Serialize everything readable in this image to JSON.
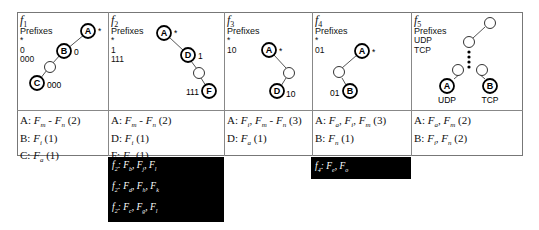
{
  "columns": [
    {
      "id": "f1",
      "title": "f",
      "title_sub": "1",
      "prefix_label": "Prefixes",
      "prefixes": [
        "*",
        "0",
        "000"
      ],
      "tree": {
        "nodes": [
          {
            "label": "A",
            "annotation": "*"
          },
          {
            "label": "B",
            "annotation": "0"
          },
          {
            "label": "",
            "annotation": ""
          },
          {
            "label": "C",
            "annotation": "000"
          }
        ]
      },
      "rules": [
        {
          "node": "A",
          "text": "A: ",
          "flows": "F",
          "sub1": "m",
          "sep": " - ",
          "flows2": "F",
          "sub2": "n",
          "count": " (2)"
        },
        {
          "node": "B",
          "text": "B: ",
          "flows": "F",
          "sub1": "i",
          "count": " (1)"
        },
        {
          "node": "C",
          "text": "C: ",
          "flows": "F",
          "sub1": "a",
          "count": " (1)"
        }
      ]
    },
    {
      "id": "f2",
      "title": "f",
      "title_sub": "2",
      "prefix_label": "Prefixes",
      "prefixes": [
        "*",
        "1",
        "111"
      ],
      "tree": {
        "nodes": [
          {
            "label": "A",
            "annotation": "*"
          },
          {
            "label": "D",
            "annotation": "1"
          },
          {
            "label": "",
            "annotation": ""
          },
          {
            "label": "F",
            "annotation": "111"
          }
        ]
      },
      "rules": [
        {
          "node": "A",
          "text": "A: ",
          "flows": "F",
          "sub1": "m",
          "sep": " - ",
          "flows2": "F",
          "sub2": "n",
          "count": " (2)"
        },
        {
          "node": "D",
          "text": "D: ",
          "flows": "F",
          "sub1": "i",
          "count": " (1)"
        },
        {
          "node": "F",
          "text": "F: ",
          "flows": "F",
          "sub1": "a",
          "count": " (1)"
        }
      ],
      "overflow": [
        {
          "f": "f",
          "fsub": "2",
          "items": [
            {
              "F": "F",
              "s": "b"
            },
            {
              "F": "F",
              "s": "j"
            },
            {
              "F": "F",
              "s": "l"
            }
          ]
        },
        {
          "f": "f",
          "fsub": "2",
          "items": [
            {
              "F": "F",
              "s": "d"
            },
            {
              "F": "F",
              "s": "h"
            },
            {
              "F": "F",
              "s": "k"
            }
          ]
        },
        {
          "f": "f",
          "fsub": "2",
          "items": [
            {
              "F": "F",
              "s": "c"
            },
            {
              "F": "F",
              "s": "g"
            },
            {
              "F": "F",
              "s": "l"
            }
          ]
        }
      ]
    },
    {
      "id": "f3",
      "title": "f",
      "title_sub": "3",
      "prefix_label": "Prefixes",
      "prefixes": [
        "*",
        "10"
      ],
      "tree": {
        "nodes": [
          {
            "label": "A",
            "annotation": "*"
          },
          {
            "label": "",
            "annotation": ""
          },
          {
            "label": "D",
            "annotation": "10"
          }
        ]
      },
      "rules": [
        {
          "node": "A",
          "text": "A: ",
          "flows": "F",
          "sub1": "i",
          "mid": ", ",
          "flowsM": "F",
          "subM": "m",
          "sep": " - ",
          "flows2": "F",
          "sub2": "n",
          "count": " (3)"
        },
        {
          "node": "D",
          "text": "D: ",
          "flows": "F",
          "sub1": "a",
          "count": " (1)"
        }
      ]
    },
    {
      "id": "f4",
      "title": "f",
      "title_sub": "4",
      "prefix_label": "Prefixes",
      "prefixes": [
        "*",
        "01"
      ],
      "tree": {
        "nodes": [
          {
            "label": "A",
            "annotation": "*"
          },
          {
            "label": "",
            "annotation": ""
          },
          {
            "label": "B",
            "annotation": "01"
          }
        ]
      },
      "rules": [
        {
          "node": "A",
          "text": "A: ",
          "flows": "F",
          "sub1": "a",
          "mid": ", ",
          "flowsM": "F",
          "subM": "i",
          "sep": ", ",
          "flows2": "F",
          "sub2": "m",
          "count": " (3)"
        },
        {
          "node": "B",
          "text": "B: ",
          "flows": "F",
          "sub1": "n",
          "count": " (1)"
        }
      ],
      "overflow": [
        {
          "f": "f",
          "fsub": "4",
          "items": [
            {
              "F": "F",
              "s": "e"
            },
            {
              "F": "F",
              "s": "o"
            }
          ]
        }
      ]
    },
    {
      "id": "f5",
      "title": "f",
      "title_sub": "5",
      "prefix_label": "Prefixes",
      "prefixes": [
        "UDP",
        "TCP"
      ],
      "tree": {
        "nodes": [
          {
            "label": "",
            "annotation": ""
          },
          {
            "label": "",
            "annotation": ""
          },
          {
            "label": "",
            "annotation": ""
          },
          {
            "label": "",
            "annotation": ""
          },
          {
            "label": "A",
            "annotation": "UDP"
          },
          {
            "label": "B",
            "annotation": "TCP"
          }
        ]
      },
      "rules": [
        {
          "node": "A",
          "text": "A: ",
          "flows": "F",
          "sub1": "a",
          "sep": ", ",
          "flows2": "F",
          "sub2": "m",
          "count": " (2)"
        },
        {
          "node": "B",
          "text": "B: ",
          "flows": "F",
          "sub1": "i",
          "sep": ", ",
          "flows2": "F",
          "sub2": "n",
          "count": " (2)"
        }
      ]
    }
  ],
  "colors": {
    "border": "#777777",
    "overflow_bg": "#000000",
    "overflow_text": "#ffffff"
  }
}
